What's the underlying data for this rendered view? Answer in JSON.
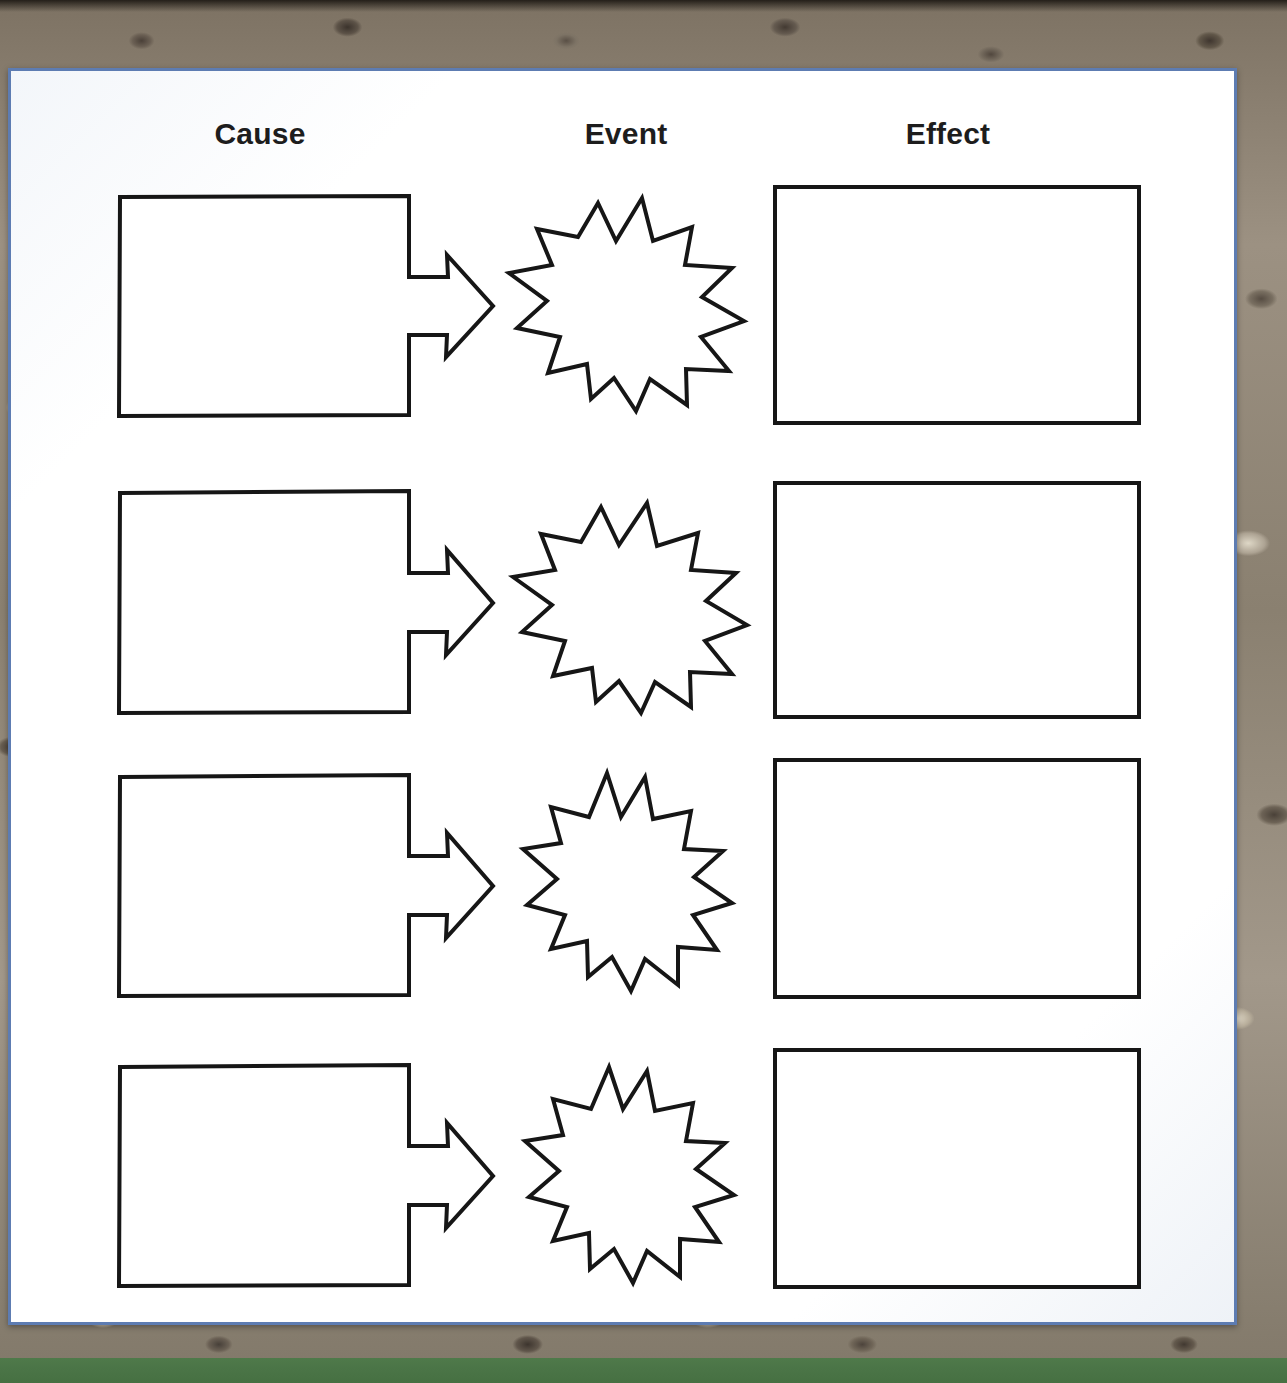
{
  "worksheet": {
    "title": "Cause / Event / Effect Graphic Organizer",
    "page_border_color": "#5d7cb2",
    "page_background_color": "#fdfdfc",
    "shape_outline_color": "#161616",
    "header_text_color": "#1d1d1d"
  },
  "backdrop": {
    "type": "photograph",
    "description": "gravel and stones",
    "gravel_color": "#8d8376",
    "grass_color": "#4b7547"
  },
  "headers": {
    "cause": "Cause",
    "event": "Event",
    "effect": "Effect"
  },
  "rows": [
    {
      "index": 1,
      "cause_label": "",
      "cause_placeholder": "",
      "event_label": "",
      "event_placeholder": "",
      "effect_label": "",
      "effect_placeholder": ""
    },
    {
      "index": 2,
      "cause_label": "",
      "cause_placeholder": "",
      "event_label": "",
      "event_placeholder": "",
      "effect_label": "",
      "effect_placeholder": ""
    },
    {
      "index": 3,
      "cause_label": "",
      "cause_placeholder": "",
      "event_label": "",
      "event_placeholder": "",
      "effect_label": "",
      "effect_placeholder": ""
    },
    {
      "index": 4,
      "cause_label": "",
      "cause_placeholder": "",
      "event_label": "",
      "event_placeholder": "",
      "effect_label": "",
      "effect_placeholder": ""
    }
  ],
  "shapes": {
    "cause_shape": "rectangle-with-right-arrow",
    "event_shape": "starburst",
    "effect_shape": "rectangle",
    "starburst_points": 13,
    "row_count": 4
  }
}
